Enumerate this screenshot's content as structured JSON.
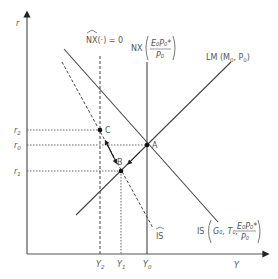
{
  "axes": {
    "y_label": "r",
    "x_label": "Y"
  },
  "y_ticks": [
    {
      "label": "r",
      "sub": "2",
      "y": 130
    },
    {
      "label": "r",
      "sub": "0",
      "y": 145
    },
    {
      "label": "r",
      "sub": "1",
      "y": 171
    }
  ],
  "x_ticks": [
    {
      "label": "Y",
      "sub": "2",
      "x": 100
    },
    {
      "label": "Y",
      "sub": "1",
      "x": 121
    },
    {
      "label": "Y",
      "sub": "0",
      "x": 147
    }
  ],
  "points": [
    {
      "name": "A",
      "x": 147,
      "y": 145
    },
    {
      "name": "B",
      "x": 121,
      "y": 171
    },
    {
      "name": "C",
      "x": 100,
      "y": 130
    }
  ],
  "curves": {
    "lm": {
      "label": "LM (M",
      "sub1": "0",
      "mid": ", P",
      "sub2": "0",
      "end": ")"
    },
    "is": {
      "label": "IS",
      "args": "G₀, T₀,",
      "frac_num": "E₀P₀*",
      "frac_den": "P₀"
    },
    "is_hat": {
      "label": "IS"
    },
    "nx": {
      "label": "NX",
      "frac_num": "E₀P₀*",
      "frac_den": "P₀"
    },
    "nx_hat": {
      "label": "NX(·) = 0"
    }
  },
  "colors": {
    "line": "#3a3a3a",
    "text": "#555555"
  }
}
